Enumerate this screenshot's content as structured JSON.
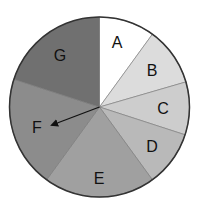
{
  "chart_data": {
    "type": "pie",
    "title": "",
    "start_angle_deg": 0,
    "direction": "clockwise",
    "categories": [
      "A",
      "B",
      "C",
      "D",
      "E",
      "F",
      "G"
    ],
    "values": [
      10,
      10.5,
      9.5,
      10,
      20,
      20,
      20
    ],
    "colors": [
      "#ffffff",
      "#dcdcdc",
      "#cdcdcd",
      "#b9b9b9",
      "#a0a0a0",
      "#8c8c8c",
      "#707070"
    ],
    "label_positions": [
      [
        117,
        42
      ],
      [
        152,
        70
      ],
      [
        163,
        108
      ],
      [
        152,
        146
      ],
      [
        99,
        178
      ],
      [
        37,
        127
      ],
      [
        60,
        55
      ]
    ],
    "annotations": [
      {
        "type": "arrow",
        "from": "center",
        "to_label": "F",
        "to": [
          52,
          125
        ]
      }
    ],
    "legend": null,
    "grid": false
  },
  "geometry": {
    "cx": 99.5,
    "cy": 107,
    "r": 90,
    "stroke": "#333333"
  }
}
